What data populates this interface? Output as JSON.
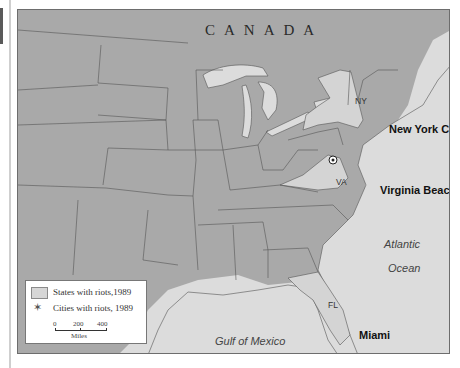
{
  "map": {
    "country_label": "CANADA",
    "state_labels": {
      "ny": "NY",
      "va": "VA",
      "fl": "FL"
    },
    "city_labels": {
      "nyc": "New York City",
      "vb": "Virginia Beach",
      "miami": "Miami"
    },
    "water_labels": {
      "atlantic_1": "Atlantic",
      "atlantic_2": "Ocean",
      "gulf": "Gulf of Mexico"
    },
    "highlighted_states": [
      "NY",
      "VA",
      "FL"
    ],
    "capital_marker": "Washington, D.C. star",
    "colors": {
      "land": "#a9a9a9",
      "highlighted_state": "#d4d4d4",
      "water": "#dcdcdc",
      "border": "#555555"
    }
  },
  "legend": {
    "states_label": "States with riots,1989",
    "cities_label": "Cities with riots, 1989",
    "scale": {
      "ticks": [
        "0",
        "200",
        "400"
      ],
      "units": "Miles"
    }
  }
}
